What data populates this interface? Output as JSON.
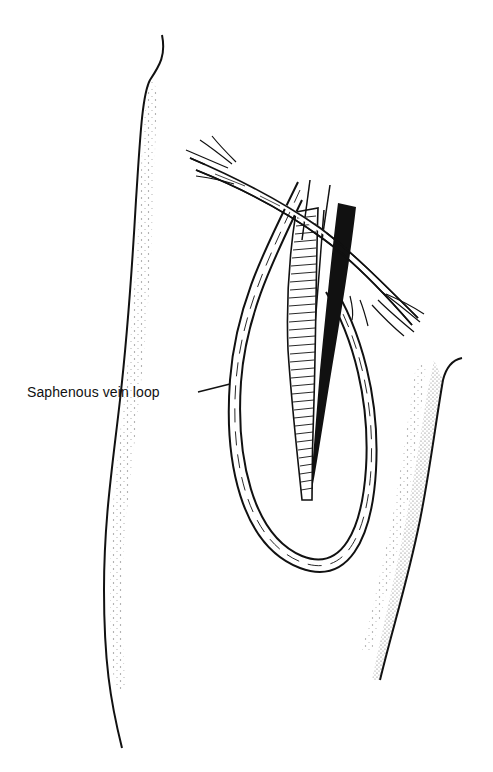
{
  "figure": {
    "type": "anatomical line illustration",
    "labels": [
      {
        "id": "saphenous-vein-loop",
        "text": "Saphenous vein loop"
      }
    ]
  },
  "colors": {
    "ink": "#111111",
    "background": "#ffffff"
  }
}
